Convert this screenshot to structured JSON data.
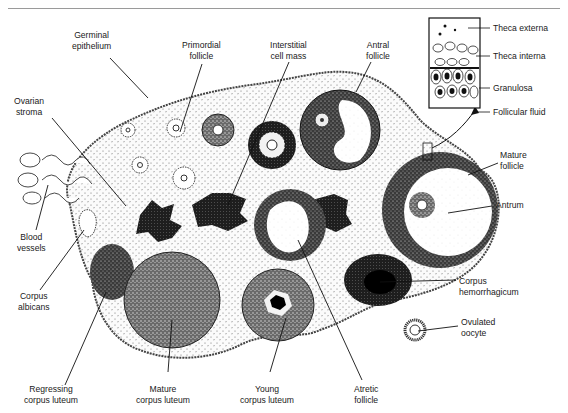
{
  "figure": {
    "labels": {
      "germinal_epithelium": [
        "Germinal",
        "epithelium"
      ],
      "primordial_follicle": [
        "Primordial",
        "follicle"
      ],
      "interstitial_cell_mass": [
        "Interstitial",
        "cell mass"
      ],
      "antral_follicle": [
        "Antral",
        "follicle"
      ],
      "ovarian_stroma": [
        "Ovarian",
        "stroma"
      ],
      "blood_vessels": [
        "Blood",
        "vessels"
      ],
      "corpus_albicans": [
        "Corpus",
        "albicans"
      ],
      "regressing_corpus_luteum": [
        "Regressing",
        "corpus luteum"
      ],
      "mature_corpus_luteum": [
        "Mature",
        "corpus luteum"
      ],
      "young_corpus_luteum": [
        "Young",
        "corpus luteum"
      ],
      "atretic_follicle": [
        "Atretic",
        "follicle"
      ],
      "corpus_hemorrhagicum": [
        "Corpus",
        "hemorrhagicum"
      ],
      "ovulated_oocyte": [
        "Ovulated",
        "oocyte"
      ],
      "mature_follicle": [
        "Mature",
        "follicle"
      ],
      "antrum": [
        "Antrum"
      ]
    },
    "inset": {
      "labels": [
        "Theca externa",
        "Theca interna",
        "Granulosa",
        "Follicular fluid"
      ]
    }
  }
}
